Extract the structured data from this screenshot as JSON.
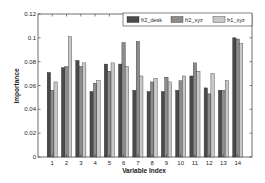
{
  "chart_data": {
    "type": "bar",
    "title": "",
    "xlabel": "Variable Index",
    "ylabel": "Importance",
    "ylim": [
      0,
      0.12
    ],
    "yticks": [
      "0",
      "0.02",
      "0.04",
      "0.06",
      "0.08",
      "0.1",
      "0.12"
    ],
    "grid": false,
    "legend_position": "top-right",
    "categories": [
      "1",
      "2",
      "3",
      "4",
      "5",
      "6",
      "7",
      "8",
      "9",
      "10",
      "11",
      "12",
      "13",
      "14"
    ],
    "series": [
      {
        "name": "fr2_desk",
        "color": "#4a4a4a",
        "values": [
          0.071,
          0.075,
          0.081,
          0.055,
          0.078,
          0.078,
          0.056,
          0.055,
          0.055,
          0.056,
          0.068,
          0.058,
          0.056,
          0.1
        ]
      },
      {
        "name": "fr2_xyz",
        "color": "#8c8c8c",
        "values": [
          0.056,
          0.076,
          0.076,
          0.062,
          0.072,
          0.096,
          0.097,
          0.063,
          0.067,
          0.064,
          0.079,
          0.053,
          0.056,
          0.099
        ]
      },
      {
        "name": "fr1_xyz",
        "color": "#c8c8c8",
        "values": [
          0.063,
          0.101,
          0.079,
          0.064,
          0.079,
          0.076,
          0.068,
          0.066,
          0.063,
          0.068,
          0.072,
          0.07,
          0.064,
          0.095
        ]
      }
    ]
  }
}
